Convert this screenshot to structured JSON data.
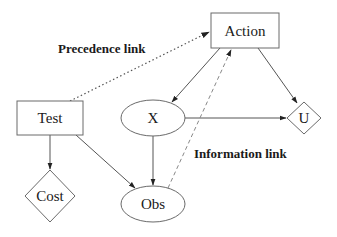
{
  "diagram": {
    "nodes": {
      "action": {
        "label": "Action",
        "shape": "rectangle"
      },
      "test": {
        "label": "Test",
        "shape": "rectangle"
      },
      "x": {
        "label": "X",
        "shape": "ellipse"
      },
      "u": {
        "label": "U",
        "shape": "diamond"
      },
      "cost": {
        "label": "Cost",
        "shape": "diamond"
      },
      "obs": {
        "label": "Obs",
        "shape": "ellipse"
      }
    },
    "edges": [
      {
        "from": "Test",
        "to": "Action",
        "style": "dotted",
        "kind": "precedence"
      },
      {
        "from": "Action",
        "to": "X",
        "style": "solid"
      },
      {
        "from": "Action",
        "to": "U",
        "style": "solid"
      },
      {
        "from": "X",
        "to": "U",
        "style": "solid"
      },
      {
        "from": "X",
        "to": "Obs",
        "style": "solid"
      },
      {
        "from": "Test",
        "to": "Obs",
        "style": "solid"
      },
      {
        "from": "Test",
        "to": "Cost",
        "style": "solid"
      },
      {
        "from": "Obs",
        "to": "Action",
        "style": "dashed",
        "kind": "information"
      }
    ],
    "annotations": {
      "precedence": "Precedence link",
      "information": "Information link"
    }
  }
}
